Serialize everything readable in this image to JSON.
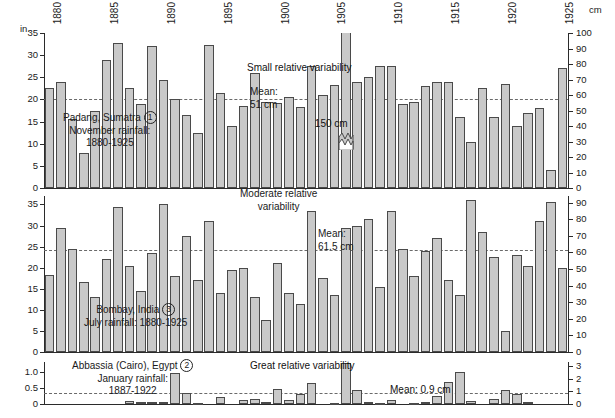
{
  "figure": {
    "left_unit": "in.",
    "right_unit": "cm",
    "years_labeled": [
      "1880",
      "1885",
      "1890",
      "1895",
      "1900",
      "1905",
      "1910",
      "1915",
      "1920",
      "1925"
    ]
  },
  "panels": [
    {
      "id": "padang",
      "title_lines": [
        "Padang, Sumatra",
        "November rainfall:",
        "1880-1925"
      ],
      "marker": "1",
      "variability_note": "Small relative variability",
      "mean_label_lines": [
        "Mean:",
        "51 cm"
      ],
      "mean_value_cm": 51,
      "mean_value_in": 20.1,
      "left_ticks": [
        "0",
        "5",
        "10",
        "15",
        "20",
        "25",
        "30",
        "35"
      ],
      "right_ticks": [
        "0",
        "10",
        "20",
        "30",
        "40",
        "50",
        "60",
        "70",
        "80",
        "90",
        "100"
      ],
      "left_max_in": 35,
      "right_max_cm": 100,
      "broken_bar_label": "150 cm",
      "broken_bar_year": 1906
    },
    {
      "id": "bombay",
      "title_lines": [
        "Bombay, India",
        "July rainfall: 1880-1925"
      ],
      "marker": "3",
      "variability_note_lines": [
        "Moderate relative",
        "variability"
      ],
      "mean_label_lines": [
        "Mean:",
        "61.5 cm"
      ],
      "mean_value_cm": 61.5,
      "mean_value_in": 24.2,
      "left_ticks": [
        "0",
        "5",
        "10",
        "15",
        "20",
        "25",
        "30",
        "35"
      ],
      "right_ticks": [
        "0",
        "10",
        "20",
        "30",
        "40",
        "50",
        "60",
        "70",
        "80",
        "90"
      ],
      "left_max_in": 37,
      "right_max_cm": 94
    },
    {
      "id": "abbassia",
      "title_lines": [
        "Abbassia (Cairo), Egypt",
        "January rainfall:",
        "1887-1922"
      ],
      "marker": "2",
      "variability_note": "Great relative variability",
      "mean_label": "Mean: 0.9 cm",
      "mean_value_cm": 0.9,
      "mean_value_in": 0.354,
      "left_ticks": [
        "0",
        "0.5",
        "1.0"
      ],
      "right_ticks": [
        "0",
        "1",
        "2",
        "3"
      ],
      "left_max_in": 1.3,
      "right_max_cm": 3.3
    }
  ],
  "chart_data": [
    {
      "type": "bar",
      "title": "Padang, Sumatra - November rainfall: 1880-1925",
      "xlabel": "Year",
      "ylabel": "in.",
      "ylabel_right": "cm",
      "ylim": [
        0,
        35
      ],
      "ylim_right": [
        0,
        100
      ],
      "grid": false,
      "mean": 20.1,
      "mean_cm": 51,
      "annotations": [
        "Small relative variability",
        "Mean: 51 cm",
        "150 cm"
      ],
      "x": [
        1880,
        1881,
        1882,
        1883,
        1884,
        1885,
        1886,
        1887,
        1888,
        1889,
        1890,
        1891,
        1892,
        1893,
        1894,
        1895,
        1896,
        1897,
        1898,
        1899,
        1900,
        1901,
        1902,
        1903,
        1904,
        1905,
        1906,
        1907,
        1908,
        1909,
        1910,
        1911,
        1912,
        1913,
        1914,
        1915,
        1916,
        1917,
        1918,
        1919,
        1920,
        1921,
        1922,
        1923,
        1924,
        1925
      ],
      "values": [
        22.5,
        24.0,
        15.5,
        8.0,
        17.5,
        29.0,
        32.8,
        22.6,
        19.0,
        32.0,
        24.3,
        20.0,
        16.5,
        12.5,
        32.3,
        21.5,
        14.0,
        18.5,
        26.0,
        19.5,
        19.3,
        20.5,
        18.3,
        27.5,
        21.0,
        23.3,
        59.0,
        24.0,
        25.0,
        27.5,
        27.5,
        19.0,
        19.5,
        23.0,
        24.0,
        24.0,
        16.0,
        10.5,
        22.5,
        16.0,
        23.5,
        14.0,
        17.0,
        18.0,
        4.0,
        27.0
      ]
    },
    {
      "type": "bar",
      "title": "Bombay, India - July rainfall: 1880-1925",
      "xlabel": "Year",
      "ylabel": "in.",
      "ylabel_right": "cm",
      "ylim": [
        0,
        37
      ],
      "ylim_right": [
        0,
        94
      ],
      "grid": false,
      "mean": 24.2,
      "mean_cm": 61.5,
      "annotations": [
        "Moderate relative variability",
        "Mean: 61.5 cm"
      ],
      "x": [
        1880,
        1881,
        1882,
        1883,
        1884,
        1885,
        1886,
        1887,
        1888,
        1889,
        1890,
        1891,
        1892,
        1893,
        1894,
        1895,
        1896,
        1897,
        1898,
        1899,
        1900,
        1901,
        1902,
        1903,
        1904,
        1905,
        1906,
        1907,
        1908,
        1909,
        1910,
        1911,
        1912,
        1913,
        1914,
        1915,
        1916,
        1917,
        1918,
        1919,
        1920,
        1921,
        1922,
        1923,
        1924,
        1925
      ],
      "values": [
        18.3,
        29.5,
        24.5,
        16.5,
        13.0,
        22.0,
        34.5,
        20.5,
        14.5,
        23.5,
        35.0,
        18.0,
        27.5,
        17.0,
        31.0,
        14.0,
        19.5,
        20.0,
        13.0,
        7.5,
        21.0,
        14.0,
        11.5,
        33.5,
        17.5,
        13.5,
        29.5,
        30.0,
        31.5,
        15.5,
        33.5,
        24.5,
        18.0,
        24.0,
        27.0,
        17.0,
        13.5,
        36.0,
        28.5,
        22.5,
        5.0,
        23.0,
        20.5,
        31.0,
        35.5,
        20.0
      ]
    },
    {
      "type": "bar",
      "title": "Abbassia (Cairo), Egypt - January rainfall: 1887-1922",
      "xlabel": "Year",
      "ylabel": "in.",
      "ylabel_right": "cm",
      "ylim": [
        0,
        1.3
      ],
      "ylim_right": [
        0,
        3.3
      ],
      "grid": false,
      "mean": 0.354,
      "mean_cm": 0.9,
      "annotations": [
        "Great relative variability",
        "Mean: 0.9 cm"
      ],
      "x": [
        1887,
        1888,
        1889,
        1890,
        1891,
        1892,
        1893,
        1894,
        1895,
        1896,
        1897,
        1898,
        1899,
        1900,
        1901,
        1902,
        1903,
        1904,
        1905,
        1906,
        1907,
        1908,
        1909,
        1910,
        1911,
        1912,
        1913,
        1914,
        1915,
        1916,
        1917,
        1918,
        1919,
        1920,
        1921,
        1922
      ],
      "values": [
        0.1,
        0.05,
        0.06,
        0.07,
        0.97,
        0.33,
        0.02,
        0.0,
        0.23,
        0.0,
        0.13,
        0.16,
        0.07,
        0.45,
        0.13,
        0.3,
        0.65,
        0.0,
        0.02,
        1.28,
        0.42,
        0.06,
        0.03,
        0.11,
        0.0,
        0.02,
        0.05,
        0.24,
        0.68,
        0.98,
        0.1,
        0.0,
        0.16,
        0.42,
        0.3,
        0.05
      ]
    }
  ]
}
